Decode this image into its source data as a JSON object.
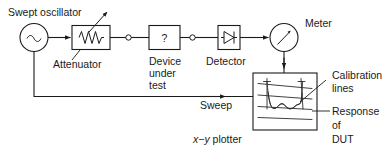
{
  "figure": {
    "background_color": "#ffffff",
    "line_color": "#1a1a1a",
    "text_color": "#1a1a1a"
  },
  "labels": {
    "swept_oscillator": "Swept oscillator",
    "attenuator": "Attenuator",
    "device_under_test_line1": "Device",
    "device_under_test_line2": "under",
    "device_under_test_line3": "test",
    "detector": "Detector",
    "meter": "Meter",
    "sweep": "Sweep",
    "xy_plotter_x": "x",
    "xy_plotter_dash": "−",
    "xy_plotter_y": "y",
    "xy_plotter_rest": " plotter",
    "calibration_line1": "Calibration",
    "calibration_line2": "lines",
    "response_line1": "Response",
    "response_line2": "of",
    "response_line3": "DUT"
  },
  "symbols": {
    "oscillator_glyph": "sine-wave-source-icon",
    "attenuator_glyph": "resistor-zigzag-icon",
    "attenuator_adjust_glyph": "adjustment-arrow-icon",
    "dut_glyph": "question-mark",
    "dut_text": "?",
    "detector_glyph": "diode-icon",
    "meter_glyph": "analog-meter-needle-icon",
    "plotter_glyph": "plot-trace-icon"
  },
  "blocks": [
    {
      "name": "swept-oscillator",
      "shape": "circle"
    },
    {
      "name": "attenuator",
      "shape": "rect"
    },
    {
      "name": "device-under-test",
      "shape": "rect"
    },
    {
      "name": "detector",
      "shape": "rect"
    },
    {
      "name": "meter",
      "shape": "circle"
    },
    {
      "name": "xy-plotter",
      "shape": "rect"
    }
  ]
}
